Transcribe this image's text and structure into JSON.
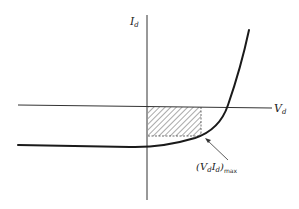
{
  "diagram": {
    "type": "diode I-V characteristic with maximum power rectangle",
    "axes": {
      "y_label": {
        "main": "I",
        "sub": "d"
      },
      "x_label": {
        "main": "V",
        "sub": "d"
      }
    },
    "annotation": {
      "open": "(",
      "v_main": "V",
      "v_sub": "d",
      "i_main": "I",
      "i_sub": "d",
      "close": ")",
      "sub": "max"
    },
    "colors": {
      "line": "#1a1a1a",
      "axis": "#333333",
      "hatch": "#555555",
      "background": "#ffffff"
    }
  }
}
